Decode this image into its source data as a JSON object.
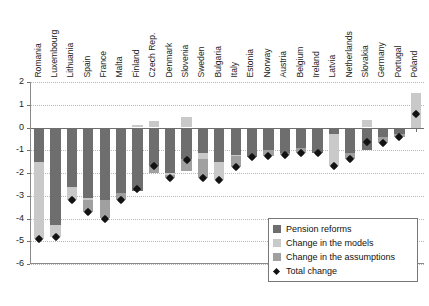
{
  "chart_data": {
    "type": "bar",
    "title": "",
    "subtitle": "",
    "xlabel": "",
    "ylabel": "",
    "ylim": [
      -6,
      2
    ],
    "yticks": [
      2,
      1,
      0,
      -1,
      -2,
      -3,
      -4,
      -5,
      -6
    ],
    "ytick_labels": [
      "2",
      "1",
      "0",
      "-1",
      "-2",
      "-3",
      "-4",
      "-5",
      "-6"
    ],
    "grid": true,
    "stacked": true,
    "legend_position": "bottom-right",
    "categories": [
      "Romania",
      "Luxembourg",
      "Lithuania",
      "Spain",
      "France",
      "Malta",
      "Finland",
      "Czech Rep.",
      "Denmark",
      "Slovenia",
      "Sweden",
      "Bulgaria",
      "Italy",
      "Estonia",
      "Norway",
      "Austria",
      "Belgium",
      "Ireland",
      "Latvia",
      "Netherlands",
      "Slovakia",
      "Germany",
      "Portugal",
      "Poland"
    ],
    "series": [
      {
        "name": "Pension reforms",
        "color": "#6e6e6e",
        "values": [
          -1.5,
          -4.3,
          -2.6,
          -3.1,
          -3.2,
          -2.9,
          -2.8,
          -1.7,
          -2.0,
          -1.4,
          -1.1,
          -1.5,
          -1.2,
          -1.3,
          -1.0,
          -1.1,
          -0.9,
          -1.1,
          -0.3,
          -1.1,
          -1.0,
          -0.4,
          -0.3,
          0.0
        ]
      },
      {
        "name": "Change in the models",
        "color": "#c9c9c9",
        "values": [
          -3.4,
          -0.5,
          -0.6,
          -0.1,
          0.0,
          0.0,
          0.1,
          0.3,
          -0.1,
          0.45,
          -0.3,
          -0.8,
          -0.05,
          0.0,
          0.0,
          0.0,
          0.0,
          0.0,
          -1.4,
          0.0,
          0.35,
          0.0,
          0.0,
          1.5
        ]
      },
      {
        "name": "Change in the assumptions",
        "color": "#a0a0a0",
        "values": [
          0.0,
          0.0,
          0.0,
          -0.5,
          -0.8,
          -0.3,
          0.0,
          -0.3,
          -0.1,
          -0.5,
          -0.8,
          0.0,
          -0.5,
          0.0,
          -0.25,
          -0.1,
          -0.2,
          0.0,
          0.0,
          -0.3,
          0.0,
          -0.3,
          -0.1,
          0.0
        ]
      }
    ],
    "total_change": {
      "name": "Total change",
      "color": "#121212",
      "marker": "diamond",
      "values": [
        -4.9,
        -4.8,
        -3.2,
        -3.7,
        -4.0,
        -3.2,
        -2.7,
        -1.7,
        -2.2,
        -1.45,
        -2.2,
        -2.3,
        -1.75,
        -1.3,
        -1.25,
        -1.2,
        -1.1,
        -1.1,
        -1.7,
        -1.4,
        -0.65,
        -0.7,
        -0.4,
        0.6
      ]
    }
  },
  "legend": {
    "items": [
      {
        "label": "Pension reforms",
        "swatch": "sw-reforms"
      },
      {
        "label": "Change in the models",
        "swatch": "sw-models"
      },
      {
        "label": "Change in the assumptions",
        "swatch": "sw-assump"
      },
      {
        "label": "Total change",
        "swatch": "sw-total"
      }
    ]
  }
}
